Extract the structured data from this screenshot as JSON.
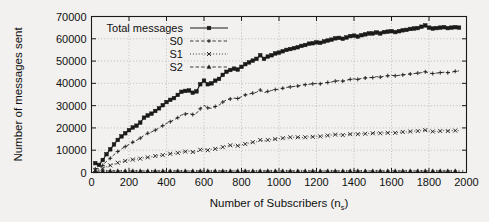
{
  "chart_data": {
    "type": "line",
    "title": "",
    "xlabel": "Number of Subscribers (n_s)",
    "xlabel_main": "Number of Subscribers (n",
    "xlabel_sub": "s",
    "xlabel_tail": ")",
    "ylabel": "Number of messages sent",
    "xlim": [
      0,
      2000
    ],
    "ylim": [
      0,
      70000
    ],
    "xticks": [
      0,
      200,
      400,
      600,
      800,
      1000,
      1200,
      1400,
      1600,
      1800,
      2000
    ],
    "yticks": [
      0,
      10000,
      20000,
      30000,
      40000,
      50000,
      60000,
      70000
    ],
    "grid": true,
    "legend_position": "top-left-inside",
    "x": [
      20,
      40,
      60,
      80,
      100,
      120,
      140,
      160,
      180,
      200,
      220,
      240,
      260,
      280,
      300,
      320,
      340,
      360,
      380,
      400,
      420,
      440,
      460,
      480,
      500,
      520,
      540,
      560,
      580,
      600,
      620,
      640,
      660,
      680,
      700,
      720,
      740,
      760,
      780,
      800,
      820,
      840,
      860,
      880,
      900,
      920,
      940,
      960,
      980,
      1000,
      1020,
      1040,
      1060,
      1080,
      1100,
      1120,
      1140,
      1160,
      1180,
      1200,
      1220,
      1240,
      1260,
      1280,
      1300,
      1320,
      1340,
      1360,
      1380,
      1400,
      1420,
      1440,
      1460,
      1480,
      1500,
      1520,
      1540,
      1560,
      1580,
      1600,
      1620,
      1640,
      1660,
      1680,
      1700,
      1720,
      1740,
      1760,
      1780,
      1800,
      1820,
      1840,
      1860,
      1880,
      1900,
      1920,
      1940,
      1960
    ],
    "series": [
      {
        "name": "Total messages",
        "marker": "square",
        "line": "solid",
        "values": [
          4200,
          3400,
          5600,
          8200,
          10400,
          12600,
          14600,
          16200,
          17600,
          19000,
          20200,
          21000,
          22400,
          24600,
          25600,
          26400,
          27600,
          28800,
          30200,
          31600,
          32600,
          33400,
          34800,
          36200,
          36600,
          36800,
          35800,
          36400,
          39600,
          41200,
          39600,
          40000,
          41200,
          42000,
          43800,
          45200,
          46000,
          46600,
          46200,
          47400,
          48600,
          49400,
          50200,
          51000,
          52600,
          51000,
          52000,
          52600,
          53400,
          53800,
          54400,
          55000,
          55400,
          55800,
          56200,
          56800,
          57200,
          57800,
          58000,
          58400,
          58200,
          58800,
          59200,
          59600,
          60200,
          60400,
          60000,
          60600,
          61200,
          61400,
          61000,
          61600,
          62000,
          62400,
          62400,
          62800,
          62400,
          63000,
          63200,
          63400,
          63000,
          63400,
          63800,
          64000,
          64400,
          64600,
          64800,
          65400,
          66000,
          65000,
          64600,
          64800,
          65000,
          65200,
          64800,
          65000,
          65200,
          65000
        ]
      },
      {
        "name": "S0",
        "marker": "plus",
        "line": "dashed",
        "values": [
          1600,
          1800,
          3200,
          5000,
          6400,
          8000,
          9400,
          10600,
          11600,
          12600,
          13600,
          14400,
          15400,
          16600,
          17600,
          18200,
          19000,
          20000,
          21000,
          22000,
          22800,
          23600,
          24600,
          25800,
          26200,
          26600,
          26000,
          26600,
          28600,
          30200,
          29000,
          28800,
          29600,
          30200,
          31600,
          32600,
          33000,
          33400,
          33200,
          34000,
          34800,
          35200,
          35600,
          36000,
          37000,
          35800,
          36400,
          36800,
          37200,
          37400,
          37800,
          38200,
          38400,
          38600,
          38800,
          39200,
          39400,
          39600,
          39800,
          40000,
          39800,
          40200,
          40400,
          40600,
          41000,
          41200,
          41000,
          41400,
          41800,
          42000,
          41800,
          42200,
          42400,
          42600,
          42600,
          43000,
          42800,
          43200,
          43400,
          43600,
          43400,
          43600,
          43800,
          44000,
          44200,
          44400,
          44600,
          44800,
          45200,
          44600,
          44400,
          44600,
          44800,
          45000,
          44800,
          45000,
          45400,
          45600
        ]
      },
      {
        "name": "S1",
        "marker": "x",
        "line": "dotted",
        "values": [
          1200,
          1200,
          1800,
          2600,
          3200,
          3800,
          4400,
          4800,
          5200,
          5600,
          5800,
          6000,
          6200,
          6600,
          6800,
          7000,
          7400,
          7600,
          7800,
          8200,
          8400,
          8600,
          8800,
          9200,
          9400,
          9600,
          9200,
          9200,
          10200,
          10400,
          10000,
          10400,
          10600,
          10800,
          11400,
          11800,
          12200,
          12200,
          12000,
          12400,
          12800,
          13200,
          13600,
          13800,
          14600,
          14200,
          14600,
          14800,
          15000,
          15200,
          15400,
          15600,
          15800,
          15800,
          15800,
          15600,
          15800,
          16000,
          16000,
          16200,
          16200,
          16400,
          16600,
          16800,
          17000,
          17000,
          16800,
          17000,
          17200,
          17400,
          17200,
          17400,
          17400,
          17600,
          17600,
          17800,
          17600,
          17800,
          17800,
          18000,
          17800,
          18000,
          18200,
          18200,
          18400,
          18600,
          18600,
          18800,
          19000,
          18600,
          18400,
          18400,
          18600,
          18800,
          18600,
          18800,
          18800,
          18800
        ]
      },
      {
        "name": "S2",
        "marker": "triangle",
        "line": "dashed",
        "values": [
          600,
          600,
          700,
          700,
          700,
          700,
          700,
          700,
          700,
          700,
          700,
          700,
          700,
          700,
          700,
          700,
          700,
          700,
          700,
          700,
          700,
          700,
          700,
          700,
          700,
          700,
          700,
          700,
          700,
          700,
          700,
          700,
          700,
          700,
          700,
          700,
          700,
          700,
          700,
          700,
          700,
          700,
          700,
          700,
          700,
          700,
          700,
          700,
          700,
          700,
          700,
          700,
          700,
          700,
          700,
          700,
          700,
          700,
          700,
          700,
          700,
          700,
          700,
          700,
          700,
          700,
          700,
          700,
          700,
          700,
          700,
          700,
          700,
          700,
          700,
          700,
          700,
          700,
          700,
          700,
          700,
          700,
          700,
          700,
          700,
          700,
          700,
          700,
          700,
          700,
          700,
          700,
          700,
          700,
          700,
          700,
          700,
          700
        ]
      }
    ]
  },
  "colors": {
    "ink": "#1a1a1a",
    "grid": "#9a9a9a",
    "background": "#f2f1ef"
  }
}
